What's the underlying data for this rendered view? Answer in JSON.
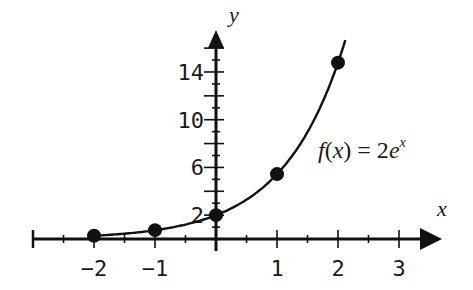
{
  "chart_data": {
    "type": "line",
    "title": "",
    "xlabel": "x",
    "ylabel": "y",
    "function_label": "f(x) = 2e^x",
    "function_label_parts": {
      "f": "f",
      "open": "(",
      "x": "x",
      "close": ")",
      "eq": " = 2",
      "e": "e",
      "exp": "x"
    },
    "xlim": [
      -3,
      3.7
    ],
    "ylim": [
      0,
      17.5
    ],
    "x_ticks": [
      -2,
      -1,
      1,
      2,
      3
    ],
    "x_tick_labels": [
      "−2",
      "−1",
      "1",
      "2",
      "3"
    ],
    "y_ticks": [
      2,
      6,
      10,
      14
    ],
    "y_tick_labels": [
      "2",
      "6",
      "10",
      14
    ],
    "y_major_tick_step": 2,
    "y_minor_tick_step": 1,
    "x_minor_tick_step": 0.5,
    "grid": false,
    "legend": null,
    "series": [
      {
        "name": "f(x) = 2e^x",
        "curve_domain": [
          -2.1,
          2.12
        ],
        "points": [
          {
            "x": -2,
            "y": 0.27
          },
          {
            "x": -1,
            "y": 0.74
          },
          {
            "x": 0,
            "y": 2.0
          },
          {
            "x": 1,
            "y": 5.44
          },
          {
            "x": 2,
            "y": 14.78
          }
        ]
      }
    ],
    "colors": {
      "line": "#111111",
      "axes": "#111111",
      "background": "#ffffff"
    }
  }
}
